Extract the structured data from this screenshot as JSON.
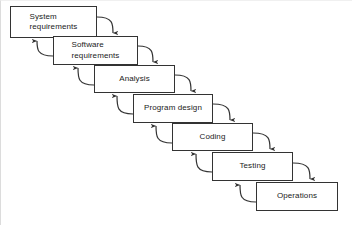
{
  "diagram": {
    "type": "flow-diagram",
    "background_color": "#ffffff",
    "stroke_color": "#333333",
    "text_color": "#1a1a1a",
    "canvas": {
      "width": 352,
      "height": 225
    },
    "stages": [
      {
        "id": "system-requirements",
        "label": "System\nrequirements",
        "lines": [
          "System",
          "requirements"
        ],
        "align": "left",
        "x": 10,
        "y": 6,
        "w": 87,
        "h": 32
      },
      {
        "id": "software-requirements",
        "label": "Software\nrequirements",
        "lines": [
          "Software",
          "requirements"
        ],
        "align": "left",
        "x": 53,
        "y": 36,
        "w": 85,
        "h": 29
      },
      {
        "id": "analysis",
        "label": "Analysis",
        "lines": [
          "Analysis"
        ],
        "align": "center",
        "x": 94,
        "y": 65,
        "w": 81,
        "h": 28
      },
      {
        "id": "program-design",
        "label": "Program design",
        "lines": [
          "Program design"
        ],
        "align": "center",
        "x": 133,
        "y": 94,
        "w": 80,
        "h": 29
      },
      {
        "id": "coding",
        "label": "Coding",
        "lines": [
          "Coding"
        ],
        "align": "center",
        "x": 172,
        "y": 123,
        "w": 81,
        "h": 28
      },
      {
        "id": "testing",
        "label": "Testing",
        "lines": [
          "Testing"
        ],
        "align": "center",
        "x": 212,
        "y": 152,
        "w": 81,
        "h": 29
      },
      {
        "id": "operations",
        "label": "Operations",
        "lines": [
          "Operations"
        ],
        "align": "center",
        "x": 256,
        "y": 182,
        "w": 82,
        "h": 29
      }
    ],
    "forward_arrows": [
      {
        "id": "system-requirements-to-software-requirements",
        "from": "system-requirements",
        "to": "software-requirements",
        "d": "M 97 17 C 113 17 113 24 113 33"
      },
      {
        "id": "software-requirements-to-analysis",
        "from": "software-requirements",
        "to": "analysis",
        "d": "M 138 46 C 153 46 153 53 153 62"
      },
      {
        "id": "analysis-to-program-design",
        "from": "analysis",
        "to": "program-design",
        "d": "M 175 75 C 191 75 191 82 191 91"
      },
      {
        "id": "program-design-to-coding",
        "from": "program-design",
        "to": "coding",
        "d": "M 213 104 C 230 104 230 111 230 120"
      },
      {
        "id": "coding-to-testing",
        "from": "coding",
        "to": "testing",
        "d": "M 253 133 C 270 133 270 140 270 149"
      },
      {
        "id": "testing-to-operations",
        "from": "testing",
        "to": "operations",
        "d": "M 293 163 C 310 163 310 170 310 179"
      }
    ],
    "feedback_arrows": [
      {
        "id": "software-requirements-to-system-requirements",
        "from": "software-requirements",
        "to": "system-requirements",
        "d": "M 53 56 C 37 56 37 49 37 41"
      },
      {
        "id": "analysis-to-software-requirements",
        "from": "analysis",
        "to": "software-requirements",
        "d": "M 94 85 C 78 85 78 78 78 68"
      },
      {
        "id": "program-design-to-analysis",
        "from": "program-design",
        "to": "analysis",
        "d": "M 133 114 C 117 114 117 107 117 96"
      },
      {
        "id": "coding-to-program-design",
        "from": "coding",
        "to": "program-design",
        "d": "M 172 143 C 156 143 156 136 156 126"
      },
      {
        "id": "testing-to-coding",
        "from": "testing",
        "to": "coding",
        "d": "M 212 172 C 196 172 196 165 196 154"
      },
      {
        "id": "operations-to-testing",
        "from": "operations",
        "to": "testing",
        "d": "M 256 202 C 240 202 240 195 240 185"
      }
    ]
  }
}
